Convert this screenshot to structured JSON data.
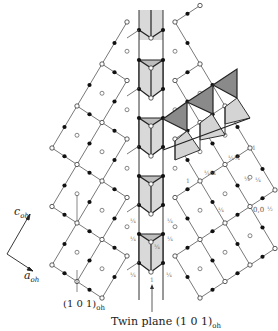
{
  "figure": {
    "type": "crystal-structure-projection",
    "axes": {
      "c_label": "c",
      "c_sub": "oh",
      "a_label": "a",
      "a_sub": "oh"
    },
    "labels": {
      "left_plane": "(1 0 1)",
      "left_plane_sub": "oh",
      "twin_plane": "Twin plane (1 0 1)",
      "twin_plane_sub": "oh"
    },
    "fractions": {
      "quarter": "¼",
      "three_quarter": "¾",
      "one": "1",
      "origin_coord": "0,0",
      "origin_frac": "½"
    },
    "legend": {
      "open_circle": "open-node",
      "filled_circle": "filled-atom",
      "dark_triangle": "dark-polyhedron",
      "light_triangle": "light-polyhedron"
    },
    "colors": {
      "line": "#444444",
      "thick_line": "#222222",
      "dark_fill": "#8a8a8a",
      "light_fill": "#d4d4d4",
      "column_fill": "#d9d9d9",
      "atom": "#111111"
    }
  }
}
